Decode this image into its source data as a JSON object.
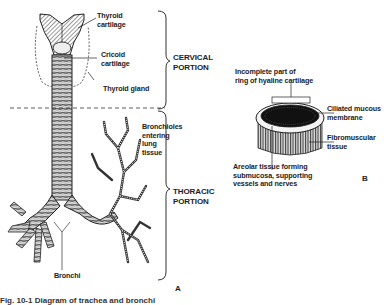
{
  "figure": {
    "panel_a": {
      "letter": "A",
      "labels": {
        "thyroid_cartilage": "Thyroid\ncartilage",
        "cricoid_cartilage": "Cricoid\ncartilage",
        "thyroid_gland": "Thyroid gland",
        "bronchioles": "Bronchioles\nentering\nlung\ntissue",
        "bronchi": "Bronchi"
      },
      "regions": {
        "cervical": "CERVICAL\nPORTION",
        "thoracic": "THORACIC\nPORTION"
      }
    },
    "panel_b": {
      "letter": "B",
      "labels": {
        "incomplete_ring": "Incomplete part of\nring of hyaline cartilage",
        "ciliated": "Ciliated mucous\nmembrane",
        "fibromuscular": "Fibromuscular\ntissue",
        "areolar": "Areolar tissue forming\nsubmucosa, supporting\nvessels and nerves"
      }
    },
    "caption": "Fig. 10-1  Diagram of trachea and bronchi"
  }
}
